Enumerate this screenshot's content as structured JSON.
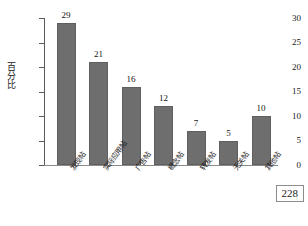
{
  "page": {
    "page_number": "228"
  },
  "chart_data": {
    "type": "bar",
    "title": "",
    "xlabel": "",
    "ylabel": "百分比",
    "categories": [
      "发现帖",
      "实际应用帖",
      "广告帖",
      "概念帖",
      "转发帖",
      "无关帖",
      "其他帖"
    ],
    "values": [
      29,
      21,
      16,
      12,
      7,
      5,
      10
    ],
    "value_labels": [
      "29",
      "21",
      "16",
      "12",
      "7",
      "5",
      "10"
    ],
    "ylim": [
      0,
      30
    ],
    "yticks": [
      0,
      5,
      10,
      15,
      20,
      25,
      30
    ],
    "ytick_labels": [
      "0",
      "5",
      "10",
      "15",
      "20",
      "25",
      "30"
    ],
    "grid": false,
    "legend": false,
    "bar_color": "#6e6e6e",
    "axis_color": "#5a5a5a"
  }
}
